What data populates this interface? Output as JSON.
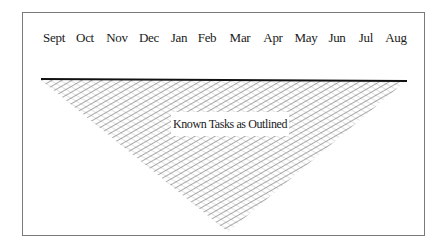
{
  "diagram": {
    "months": [
      {
        "label": "Sept",
        "x": 54
      },
      {
        "label": "Oct",
        "x": 85
      },
      {
        "label": "Nov",
        "x": 117
      },
      {
        "label": "Dec",
        "x": 149
      },
      {
        "label": "Jan",
        "x": 179
      },
      {
        "label": "Feb",
        "x": 207
      },
      {
        "label": "Mar",
        "x": 240
      },
      {
        "label": "Apr",
        "x": 273
      },
      {
        "label": "May",
        "x": 306
      },
      {
        "label": "Jun",
        "x": 337
      },
      {
        "label": "Jul",
        "x": 366
      },
      {
        "label": "Aug",
        "x": 396
      }
    ],
    "triangle_label": "Known Tasks as Outlined",
    "colors": {
      "frame": "#7a7a7a",
      "baseline": "#111111",
      "hatch": "#555555",
      "text": "#1a1a1a"
    }
  }
}
